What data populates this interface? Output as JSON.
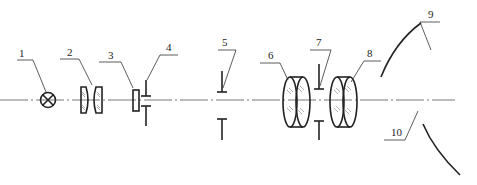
{
  "diagram": {
    "type": "optical-system-schematic",
    "colors": {
      "stroke": "#222222",
      "axis": "#555555",
      "background": "#ffffff"
    },
    "components": [
      {
        "id": 1,
        "label": "1",
        "kind": "lamp-source"
      },
      {
        "id": 2,
        "label": "2",
        "kind": "condenser-lens-pair"
      },
      {
        "id": 3,
        "label": "3",
        "kind": "filter-plate"
      },
      {
        "id": 4,
        "label": "4",
        "kind": "aperture-stop"
      },
      {
        "id": 5,
        "label": "5",
        "kind": "field-stop"
      },
      {
        "id": 6,
        "label": "6",
        "kind": "lens"
      },
      {
        "id": 7,
        "label": "7",
        "kind": "aperture-stop"
      },
      {
        "id": 8,
        "label": "8",
        "kind": "lens"
      },
      {
        "id": 9,
        "label": "9",
        "kind": "curved-mirror-upper"
      },
      {
        "id": 10,
        "label": "10",
        "kind": "curved-mirror-lower"
      }
    ]
  }
}
